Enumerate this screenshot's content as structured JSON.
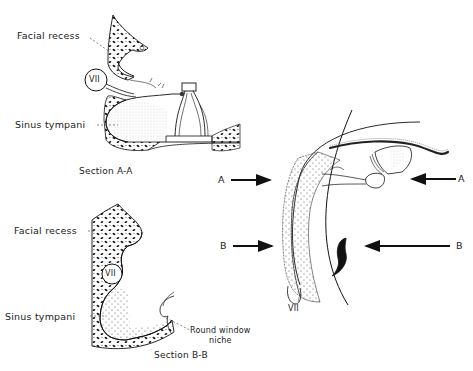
{
  "figure": {
    "top_clipped_text": [
      "··· ···",
      "···"
    ],
    "section_a": {
      "caption": "Section  A-A",
      "labels": {
        "facial_recess": "Facial recess",
        "vii": "VII",
        "sinus_tympani": "Sinus tympani"
      }
    },
    "section_b": {
      "caption": "Section  B-B",
      "labels": {
        "facial_recess": "Facial recess",
        "vii": "VII",
        "sinus_tympani": "Sinus tympani",
        "round_window_line1": "Round window",
        "round_window_line2": "niche"
      }
    },
    "overview": {
      "arrow_labels": {
        "a_left": "A",
        "a_right": "A",
        "b_left": "B",
        "b_right": "B"
      },
      "vii": "VII"
    }
  }
}
